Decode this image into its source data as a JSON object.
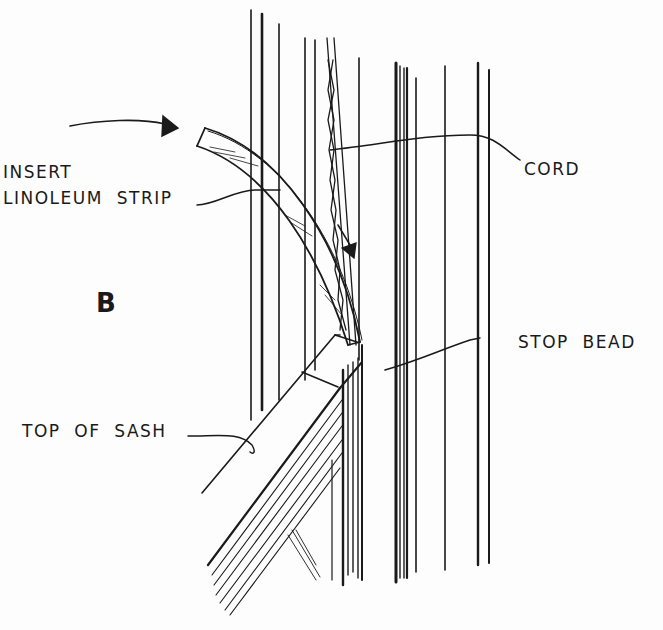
{
  "figure": {
    "panel_letter": "B",
    "colors": {
      "ink": "#1a1a1a",
      "paper": "#fdfdfd"
    }
  },
  "labels": {
    "insert_line1": "INSERT",
    "insert_line2": "LINOLEUM  STRIP",
    "cord": "CORD",
    "stop_bead": "STOP  BEAD",
    "top_of_sash": "TOP  OF  SASH"
  },
  "callouts": [
    {
      "id": "insert-linoleum-strip",
      "points_to": "curved linoleum strip"
    },
    {
      "id": "cord",
      "points_to": "sash cord in frame groove"
    },
    {
      "id": "stop-bead",
      "points_to": "vertical stop bead"
    },
    {
      "id": "top-of-sash",
      "points_to": "top rail of sash"
    }
  ],
  "arrows": [
    {
      "id": "insertion-direction-arrow",
      "direction": "right"
    },
    {
      "id": "downward-direction-arrow",
      "direction": "down"
    }
  ]
}
